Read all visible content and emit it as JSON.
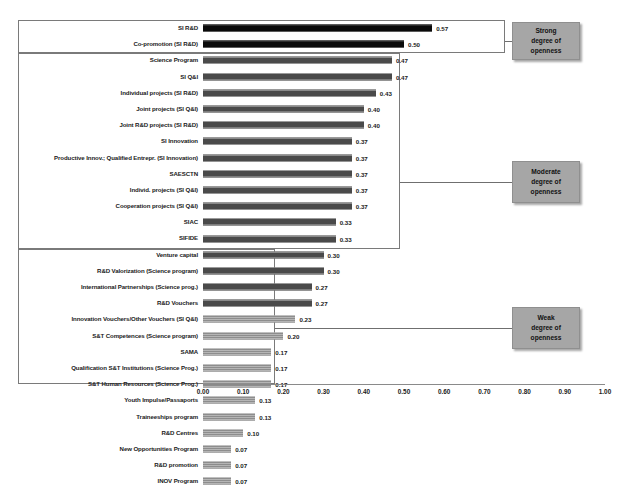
{
  "chart_data": {
    "type": "bar",
    "orientation": "horizontal",
    "title": "",
    "xlabel": "",
    "ylabel": "",
    "xlim": [
      0.0,
      1.0
    ],
    "grid": false,
    "legend_position": "right",
    "x_ticks": [
      "0.00",
      "0.10",
      "0.20",
      "0.30",
      "0.40",
      "0.50",
      "0.60",
      "0.70",
      "0.80",
      "0.90",
      "1.00"
    ],
    "x_tick_values": [
      0.0,
      0.1,
      0.2,
      0.3,
      0.4,
      0.5,
      0.6,
      0.7,
      0.8,
      0.9,
      1.0
    ],
    "categories": [
      "SI R&D",
      "Co-promotion (SI R&D)",
      "Science Program",
      "SI Q&I",
      "Individual projects (SI R&D)",
      "Joint projects (SI Q&I)",
      "Joint R&D projects (SI R&D)",
      "SI Innovation",
      "Productive Innov.; Qualified Entrepr. (SI Innovation)",
      "SAESCTN",
      "Individ. projects (SI Q&I)",
      "Cooperation projects (SI Q&I)",
      "SIAC",
      "SIFIDE",
      "Venture capital",
      "R&D Valorization (Science program)",
      "International Partnerships (Science prog.)",
      "R&D Vouchers",
      "Innovation Vouchers/Other Vouchers (SI Q&I)",
      "S&T Competences (Science program)",
      "SAMA",
      "Qualification S&T Institutions (Science Prog.)",
      "S&T Human Resources (Science Prog.)",
      "Youth Impulse/Passaports",
      "Traineeships program",
      "R&D Centres",
      "New Opportunities Program",
      "R&D promotion",
      "INOV Program"
    ],
    "values": [
      0.57,
      0.5,
      0.47,
      0.47,
      0.43,
      0.4,
      0.4,
      0.37,
      0.37,
      0.37,
      0.37,
      0.37,
      0.33,
      0.33,
      0.3,
      0.3,
      0.27,
      0.27,
      0.23,
      0.2,
      0.17,
      0.17,
      0.17,
      0.13,
      0.13,
      0.1,
      0.07,
      0.07,
      0.07
    ],
    "value_labels": [
      "0.57",
      "0.50",
      "0.47",
      "0.47",
      "0.43",
      "0.40",
      "0.40",
      "0.37",
      "0.37",
      "0.37",
      "0.37",
      "0.37",
      "0.33",
      "0.33",
      "0.30",
      "0.30",
      "0.27",
      "0.27",
      "0.23",
      "0.20",
      "0.17",
      "0.17",
      "0.17",
      "0.13",
      "0.13",
      "0.10",
      "0.07",
      "0.07",
      "0.07"
    ],
    "groups": [
      {
        "name": "strong",
        "label": "Strong\ndegree of\nopenness",
        "start_index": 0,
        "end_index": 1,
        "color": "#141414"
      },
      {
        "name": "moderate",
        "label": "Moderate\ndegree of\nopenness",
        "start_index": 2,
        "end_index": 17,
        "color": "#595959"
      },
      {
        "name": "weak",
        "label": "Weak\ndegree of\nopenness",
        "start_index": 18,
        "end_index": 28,
        "color": "#9a9a9a"
      }
    ]
  },
  "legend": {
    "strong": {
      "line1": "Strong",
      "line2": "degree of",
      "line3": "openness"
    },
    "moderate": {
      "line1": "Moderate",
      "line2": "degree of",
      "line3": "openness"
    },
    "weak": {
      "line1": "Weak",
      "line2": "degree of",
      "line3": "openness"
    }
  },
  "colors": {
    "strong_bar": "#141414",
    "moderate_bar": "#595959",
    "weak_bar": "#9a9a9a",
    "legend_box": "#a6a6a6",
    "frame_border": "#7a7a7a",
    "axis": "#8a8a8a",
    "text": "#1a1a1a",
    "background": "#ffffff"
  }
}
